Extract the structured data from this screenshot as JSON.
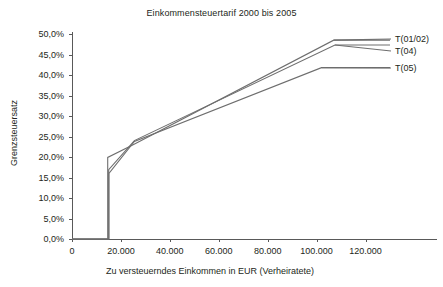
{
  "chart_data": {
    "type": "line",
    "title": "Einkommensteuertarif 2000 bis 2005",
    "xlabel": "Zu versteuerndes Einkommen in EUR (Verheiratete)",
    "ylabel": "Grenzsteuersatz",
    "xlim": [
      0,
      130000
    ],
    "ylim": [
      0,
      50
    ],
    "grid": false,
    "legend_position": "right",
    "xticks": [
      0,
      20000,
      40000,
      60000,
      80000,
      100000,
      120000
    ],
    "xtick_labels": [
      "0",
      "20.000",
      "40.000",
      "60.000",
      "80.000",
      "100.000",
      "120.000"
    ],
    "yticks": [
      0,
      5,
      10,
      15,
      20,
      25,
      30,
      35,
      40,
      45,
      50
    ],
    "ytick_labels": [
      "0,0%",
      "5,0%",
      "10,0%",
      "15,0%",
      "20,0%",
      "25,0%",
      "30,0%",
      "35,0%",
      "40,0%",
      "45,0%",
      "50,0%"
    ],
    "series": [
      {
        "name": "T(01/02)",
        "color": "#6e6e6e",
        "points": [
          [
            0,
            0
          ],
          [
            14600,
            0
          ],
          [
            14600,
            19.9
          ],
          [
            25000,
            23.0
          ],
          [
            107000,
            48.5
          ],
          [
            130000,
            48.5
          ]
        ]
      },
      {
        "name": "T(04)",
        "color": "#6e6e6e",
        "points": [
          [
            0,
            0
          ],
          [
            15000,
            0
          ],
          [
            15000,
            16.9
          ],
          [
            25500,
            24.0
          ],
          [
            107500,
            47.3
          ],
          [
            130000,
            47.3
          ]
        ]
      },
      {
        "name": "T(05)",
        "color": "#6e6e6e",
        "points": [
          [
            0,
            0
          ],
          [
            15100,
            0
          ],
          [
            15100,
            16.0
          ],
          [
            25500,
            23.8
          ],
          [
            102000,
            41.8
          ],
          [
            130000,
            41.8
          ]
        ]
      }
    ]
  },
  "legend": {
    "entries": [
      {
        "label": "T(01/02)"
      },
      {
        "label": "T(04)"
      },
      {
        "label": "T(05)"
      }
    ]
  }
}
